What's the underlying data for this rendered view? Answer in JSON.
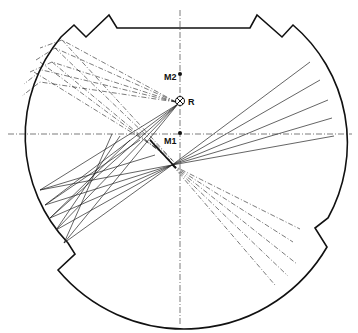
{
  "diagram": {
    "title": "",
    "labels": {
      "m2": "M2",
      "m1": "M1",
      "r": "R"
    },
    "points": {
      "M2": {
        "x": 180,
        "y": 74
      },
      "R": {
        "x": 180,
        "y": 101
      },
      "M1": {
        "x": 180,
        "y": 133
      },
      "mirror_point": {
        "x": 173,
        "y": 165
      }
    },
    "outline": {
      "type": "truncated circle with notches",
      "top_flat_y": 28,
      "bottom_arc_bottom_y": 306
    },
    "axes": {
      "vertical_x": 180,
      "horizontal_y": 134
    },
    "ray_groups": [
      {
        "name": "upper-left-dashed",
        "style": "dash-dot",
        "origin": "R"
      },
      {
        "name": "left-solid-fan",
        "style": "solid",
        "origin": "R"
      },
      {
        "name": "lower-left-solid-fan",
        "style": "solid",
        "origin": "mirror_point"
      },
      {
        "name": "right-solid-fan",
        "style": "solid",
        "origin": "mirror_point"
      },
      {
        "name": "lower-right-dashed",
        "style": "dash-dot",
        "origin": "mirror_point"
      }
    ],
    "colors": {
      "line": "#111111",
      "background": "#ffffff"
    }
  }
}
